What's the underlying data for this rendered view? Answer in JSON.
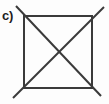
{
  "figure": {
    "label": "c)",
    "caption_position": "top-left",
    "background_color": "#fdfdfd",
    "stroke_color": "#3a3a3a",
    "stroke_width": 2
  },
  "diagram_data": {
    "type": "line-drawing",
    "shapes": [
      {
        "name": "square-outline",
        "kind": "polygon",
        "closed": true,
        "points": [
          [
            24,
            16
          ],
          [
            92,
            16
          ],
          [
            92,
            88
          ],
          [
            24,
            88
          ]
        ]
      },
      {
        "name": "diagonal-tl-br",
        "kind": "line",
        "points": [
          [
            16,
            6
          ],
          [
            101,
            96
          ]
        ]
      },
      {
        "name": "diagonal-tr-bl",
        "kind": "line",
        "points": [
          [
            104,
            7
          ],
          [
            13,
            98
          ]
        ]
      }
    ],
    "vertices": {
      "top_left": [
        24,
        16
      ],
      "top_right": [
        92,
        16
      ],
      "bottom_right": [
        92,
        88
      ],
      "bottom_left": [
        24,
        88
      ],
      "center": [
        58,
        52
      ]
    }
  }
}
